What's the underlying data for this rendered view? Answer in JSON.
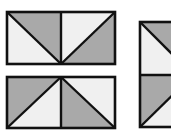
{
  "diagram": {
    "title": "",
    "colors": {
      "background": "#ffffff",
      "dark_fill": "#a9a9a9",
      "light_fill": "#f0f0f0",
      "stroke": "#111111"
    },
    "figures": [
      {
        "id": "top-rectangle",
        "type": "rectangle-two-cells",
        "cells": [
          {
            "position": "left",
            "diagonal": "top-left to bottom-right",
            "shaded": "upper-right"
          },
          {
            "position": "right",
            "diagonal": "bottom-left to top-right",
            "shaded": "lower-right"
          }
        ]
      },
      {
        "id": "bottom-rectangle",
        "type": "rectangle-two-cells",
        "cells": [
          {
            "position": "left",
            "diagonal": "bottom-left to top-right",
            "shaded": "upper-left"
          },
          {
            "position": "right",
            "diagonal": "top-left to bottom-right",
            "shaded": "lower-left"
          }
        ]
      },
      {
        "id": "right-vertical-shape",
        "type": "rectangle-two-cells-vertical",
        "cells": [
          {
            "position": "top",
            "diagonal": "top-left to bottom-right",
            "shaded": "upper-right"
          },
          {
            "position": "bottom",
            "diagonal": "bottom-left to top-right",
            "shaded": "upper-left"
          }
        ]
      }
    ]
  }
}
